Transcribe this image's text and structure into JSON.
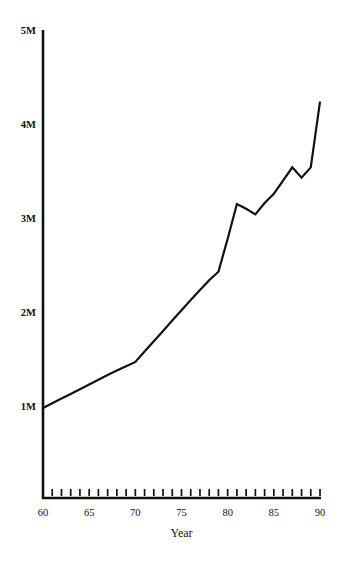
{
  "chart_data": {
    "type": "line",
    "title": "",
    "xlabel": "Year",
    "ylabel": "",
    "xlim": [
      60,
      90
    ],
    "ylim": [
      0,
      5000000
    ],
    "grid": false,
    "legend": null,
    "y_tick_labels": [
      "1M",
      "2M",
      "3M",
      "4M",
      "5M"
    ],
    "y_tick_values": [
      1000000,
      2000000,
      3000000,
      4000000,
      5000000
    ],
    "x_tick_labels": [
      "60",
      "65",
      "70",
      "75",
      "80",
      "85",
      "90"
    ],
    "x_tick_values": [
      60,
      65,
      70,
      75,
      80,
      85,
      90
    ],
    "x_minor_tick_values": [
      60,
      61,
      62,
      63,
      64,
      65,
      66,
      67,
      68,
      69,
      70,
      71,
      72,
      73,
      74,
      75,
      76,
      77,
      78,
      79,
      80,
      81,
      82,
      83,
      84,
      85,
      86,
      87,
      88,
      89,
      90
    ],
    "line_color": "#111111",
    "series": [
      {
        "name": "value",
        "x": [
          60,
          61,
          62,
          63,
          64,
          65,
          66,
          67,
          68,
          69,
          70,
          71,
          72,
          73,
          74,
          75,
          76,
          77,
          78,
          79,
          80,
          81,
          82,
          83,
          84,
          85,
          86,
          87,
          88,
          89,
          90
        ],
        "values": [
          1000000,
          1050000,
          1100000,
          1150000,
          1200000,
          1250000,
          1300000,
          1350000,
          1400000,
          1445000,
          1490000,
          1600000,
          1710000,
          1820000,
          1930000,
          2040000,
          2150000,
          2255000,
          2360000,
          2450000,
          2800000,
          3170000,
          3120000,
          3060000,
          3180000,
          3280000,
          3420000,
          3560000,
          3450000,
          3560000,
          4260000
        ]
      }
    ]
  },
  "labels": {
    "x_axis_title": "Year"
  }
}
